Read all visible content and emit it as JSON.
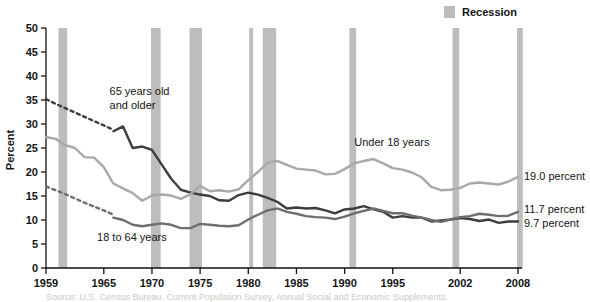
{
  "chart_data": {
    "type": "line",
    "title": "",
    "xlabel": "",
    "ylabel": "Percent",
    "ylim": [
      0,
      50
    ],
    "xlim": [
      1959,
      2008
    ],
    "grid": false,
    "y_ticks": [
      0,
      5,
      10,
      15,
      20,
      25,
      30,
      35,
      40,
      45,
      50
    ],
    "y_tick_labels": [
      "0",
      "5",
      "10",
      "15",
      "20",
      "25",
      "30",
      "35",
      "40",
      "45",
      "50"
    ],
    "x_ticks": [
      1959,
      1965,
      1970,
      1975,
      1980,
      1985,
      1990,
      1995,
      2002,
      2008
    ],
    "x_tick_labels": [
      "1959",
      "1965",
      "1970",
      "1975",
      "1980",
      "1985",
      "1990",
      "1995",
      "2002",
      "2008"
    ],
    "legend": {
      "position": "top-right",
      "entries": [
        {
          "label": "Recession",
          "color": "#bdbdbd",
          "marker": "square"
        }
      ]
    },
    "annotations": [
      {
        "id": "label-65-and-older",
        "text": "65 years old",
        "x": 1965.6,
        "y": 36.0
      },
      {
        "id": "label-65-and-older-line2",
        "text": "and older",
        "x": 1965.6,
        "y": 33.2
      },
      {
        "id": "label-under-18",
        "text": "Under 18 years",
        "x": 1991.0,
        "y": 25.5
      },
      {
        "id": "label-18-to-64",
        "text": "18 to 64 years",
        "x": 1964.3,
        "y": 5.6
      }
    ],
    "end_labels": [
      {
        "id": "end-label-under-18",
        "text": "19.0 percent",
        "value": 19.0,
        "series": "Under 18 years"
      },
      {
        "id": "end-label-18-to-64",
        "text": "11.7 percent",
        "value": 11.7,
        "series": "18 to 64 years"
      },
      {
        "id": "end-label-65-older",
        "text": "9.7 percent",
        "value": 9.7,
        "series": "65 years old and older"
      }
    ],
    "series": [
      {
        "name": "65 years old and older",
        "color": "#3d3d3d",
        "width": 2.4,
        "dashed_segment": {
          "note": "interpolated 1959-1966",
          "points": [
            [
              1959,
              35.2
            ],
            [
              1960,
              34.2
            ],
            [
              1961,
              33.3
            ],
            [
              1962,
              32.4
            ],
            [
              1963,
              31.5
            ],
            [
              1964,
              30.6
            ],
            [
              1965,
              29.7
            ],
            [
              1966,
              28.8
            ]
          ]
        },
        "x": [
          1966,
          1967,
          1968,
          1969,
          1970,
          1971,
          1972,
          1973,
          1974,
          1975,
          1976,
          1977,
          1978,
          1979,
          1980,
          1981,
          1982,
          1983,
          1984,
          1985,
          1986,
          1987,
          1988,
          1989,
          1990,
          1991,
          1992,
          1993,
          1994,
          1995,
          1996,
          1997,
          1998,
          1999,
          2000,
          2001,
          2002,
          2003,
          2004,
          2005,
          2006,
          2007,
          2008
        ],
        "values": [
          28.5,
          29.5,
          25.0,
          25.3,
          24.6,
          21.6,
          18.6,
          16.3,
          15.7,
          15.3,
          15.0,
          14.1,
          14.0,
          15.2,
          15.7,
          15.3,
          14.6,
          13.8,
          12.4,
          12.6,
          12.4,
          12.5,
          12.0,
          11.4,
          12.2,
          12.4,
          12.9,
          12.2,
          11.7,
          10.5,
          10.8,
          10.5,
          10.5,
          9.7,
          9.9,
          10.1,
          10.4,
          10.2,
          9.8,
          10.1,
          9.4,
          9.7,
          9.7
        ]
      },
      {
        "name": "Under 18 years",
        "color": "#a8a8a8",
        "width": 2.4,
        "dashed_segment": null,
        "x": [
          1959,
          1960,
          1961,
          1962,
          1963,
          1964,
          1965,
          1966,
          1967,
          1968,
          1969,
          1970,
          1971,
          1972,
          1973,
          1974,
          1975,
          1976,
          1977,
          1978,
          1979,
          1980,
          1981,
          1982,
          1983,
          1984,
          1985,
          1986,
          1987,
          1988,
          1989,
          1990,
          1991,
          1992,
          1993,
          1994,
          1995,
          1996,
          1997,
          1998,
          1999,
          2000,
          2001,
          2002,
          2003,
          2004,
          2005,
          2006,
          2007,
          2008
        ],
        "values": [
          27.3,
          26.9,
          25.6,
          25.0,
          23.1,
          23.0,
          21.0,
          17.6,
          16.6,
          15.6,
          14.0,
          15.1,
          15.3,
          15.1,
          14.4,
          15.4,
          17.1,
          16.0,
          16.2,
          15.9,
          16.4,
          18.3,
          20.0,
          21.9,
          22.3,
          21.5,
          20.7,
          20.5,
          20.3,
          19.5,
          19.6,
          20.6,
          21.8,
          22.3,
          22.7,
          21.8,
          20.8,
          20.5,
          19.9,
          18.9,
          16.9,
          16.2,
          16.3,
          16.7,
          17.6,
          17.8,
          17.6,
          17.4,
          18.0,
          19.0
        ]
      },
      {
        "name": "18 to 64 years",
        "color": "#6e6e6e",
        "width": 2.4,
        "dashed_segment": {
          "note": "interpolated 1959-1966",
          "points": [
            [
              1959,
              17.0
            ],
            [
              1960,
              16.2
            ],
            [
              1961,
              15.4
            ],
            [
              1962,
              14.5
            ],
            [
              1963,
              13.6
            ],
            [
              1964,
              12.8
            ],
            [
              1965,
              12.0
            ],
            [
              1966,
              11.1
            ]
          ]
        },
        "x": [
          1966,
          1967,
          1968,
          1969,
          1970,
          1971,
          1972,
          1973,
          1974,
          1975,
          1976,
          1977,
          1978,
          1979,
          1980,
          1981,
          1982,
          1983,
          1984,
          1985,
          1986,
          1987,
          1988,
          1989,
          1990,
          1991,
          1992,
          1993,
          1994,
          1995,
          1996,
          1997,
          1998,
          1999,
          2000,
          2001,
          2002,
          2003,
          2004,
          2005,
          2006,
          2007,
          2008
        ],
        "values": [
          10.5,
          10.0,
          9.0,
          8.7,
          9.0,
          9.3,
          9.0,
          8.3,
          8.3,
          9.2,
          9.0,
          8.8,
          8.7,
          8.9,
          10.1,
          11.1,
          12.0,
          12.4,
          11.7,
          11.3,
          10.8,
          10.6,
          10.5,
          10.2,
          10.7,
          11.4,
          11.9,
          12.4,
          11.9,
          11.4,
          11.4,
          10.9,
          10.5,
          10.0,
          9.6,
          10.1,
          10.6,
          10.8,
          11.3,
          11.1,
          10.8,
          10.9,
          11.7
        ]
      }
    ],
    "recessions": [
      {
        "start": 1960.3,
        "end": 1961.2
      },
      {
        "start": 1969.9,
        "end": 1970.9
      },
      {
        "start": 1973.9,
        "end": 1975.2
      },
      {
        "start": 1980.1,
        "end": 1980.5
      },
      {
        "start": 1981.5,
        "end": 1982.9
      },
      {
        "start": 1990.5,
        "end": 1991.2
      },
      {
        "start": 2001.2,
        "end": 2001.9
      },
      {
        "start": 2007.9,
        "end": 2008.5
      }
    ],
    "recession_color": "#bdbdbd"
  },
  "legend": {
    "recession_label": "Recession"
  },
  "caption": {
    "ghost_text": "Source: U.S. Census Bureau, Current Population Survey, Annual Social and Economic Supplements."
  }
}
